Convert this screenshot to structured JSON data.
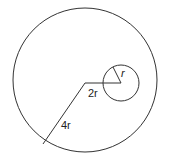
{
  "diagram": {
    "labels": {
      "small_radius": "r",
      "offset": "2r",
      "large_radius": "4r"
    },
    "colors": {
      "stroke": "#333333",
      "background": "#ffffff"
    }
  }
}
